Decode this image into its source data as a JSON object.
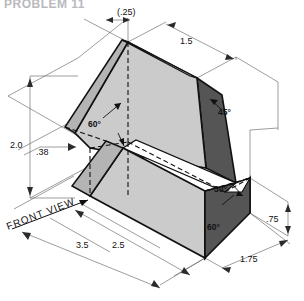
{
  "sheet": {
    "title": "PROBLEM 11",
    "view_label": "FRONT VIEW"
  },
  "colors": {
    "face_light": "#cbcbcb",
    "face_mid": "#b4b4b4",
    "face_dark": "#555555",
    "face_white": "#ffffff",
    "line": "#111111",
    "thin_line": "#5a5a5a",
    "title": "#b9b9bd"
  },
  "dimensions": [
    {
      "name": "top-notch-width",
      "value": "(.25)"
    },
    {
      "name": "top-right-length",
      "value": "1.5"
    },
    {
      "name": "overall-height",
      "value": "2.0"
    },
    {
      "name": "left-offset",
      "value": ".38"
    },
    {
      "name": "base-length",
      "value": "3.5"
    },
    {
      "name": "mid-length",
      "value": "2.5"
    },
    {
      "name": "right-height",
      "value": ".75"
    },
    {
      "name": "depth",
      "value": "1.75"
    }
  ],
  "angles": [
    {
      "name": "left-face-angle",
      "value": "60°"
    },
    {
      "name": "right-top-angle",
      "value": "45°"
    },
    {
      "name": "right-upper-angle",
      "value": "30°"
    },
    {
      "name": "right-lower-angle",
      "value": "60°"
    }
  ]
}
